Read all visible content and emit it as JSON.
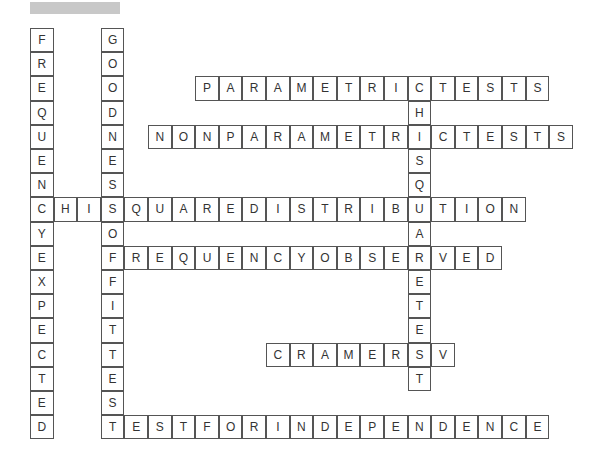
{
  "puzzle": {
    "title_redacted": true,
    "origin": {
      "x": 30,
      "y": 28
    },
    "cell": {
      "w": 23.6,
      "h": 24.2
    },
    "words": [
      {
        "word": "FREQUENCYEXPECTED",
        "row": 0,
        "col": 0,
        "dir": "down"
      },
      {
        "word": "GOODNESSOFFITTEST",
        "row": 0,
        "col": 3,
        "dir": "down"
      },
      {
        "word": "PARAMETRICTESTS",
        "row": 2,
        "col": 7,
        "dir": "across"
      },
      {
        "word": "CHISQUARETEST",
        "row": 2,
        "col": 16,
        "dir": "down"
      },
      {
        "word": "NONPARAMETRICTESTS",
        "row": 4,
        "col": 5,
        "dir": "across"
      },
      {
        "word": "CHISQUAREDISTRIBUTION",
        "row": 7,
        "col": 0,
        "dir": "across"
      },
      {
        "word": "FREQUENCYOBSERVED",
        "row": 9,
        "col": 3,
        "dir": "across"
      },
      {
        "word": "CRAMERSV",
        "row": 13,
        "col": 10,
        "dir": "across"
      },
      {
        "word": "TESTFORINDEPENDENCE",
        "row": 16,
        "col": 3,
        "dir": "across"
      }
    ]
  }
}
